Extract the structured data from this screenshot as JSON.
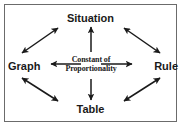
{
  "diagram": {
    "border_color": "#6b6b6b",
    "background_color": "#ffffff",
    "line_color": "#1a1a1a",
    "center": {
      "name": "constant-of-proportionality",
      "line1": "Constant of",
      "line2": "Proportionality"
    },
    "nodes": [
      {
        "id": "situation",
        "label": "Situation",
        "position": "top"
      },
      {
        "id": "graph",
        "label": "Graph",
        "position": "left"
      },
      {
        "id": "rule",
        "label": "Rule",
        "position": "right"
      },
      {
        "id": "table",
        "label": "Table",
        "position": "bottom"
      }
    ],
    "connections": [
      {
        "id": "graph-situation",
        "from": "Graph",
        "to": "Situation",
        "style": "double-headed-arrow"
      },
      {
        "id": "situation-rule",
        "from": "Situation",
        "to": "Rule",
        "style": "double-headed-arrow"
      },
      {
        "id": "graph-table",
        "from": "Graph",
        "to": "Table",
        "style": "double-headed-arrow"
      },
      {
        "id": "table-rule",
        "from": "Table",
        "to": "Rule",
        "style": "double-headed-arrow"
      },
      {
        "id": "center-situation",
        "from": "Constant of Proportionality",
        "to": "Situation",
        "style": "single-headed-arrow"
      },
      {
        "id": "center-graph",
        "from": "Constant of Proportionality",
        "to": "Graph",
        "style": "single-headed-arrow"
      },
      {
        "id": "center-rule",
        "from": "Constant of Proportionality",
        "to": "Rule",
        "style": "single-headed-arrow"
      },
      {
        "id": "center-table",
        "from": "Constant of Proportionality",
        "to": "Table",
        "style": "single-headed-arrow"
      }
    ]
  }
}
